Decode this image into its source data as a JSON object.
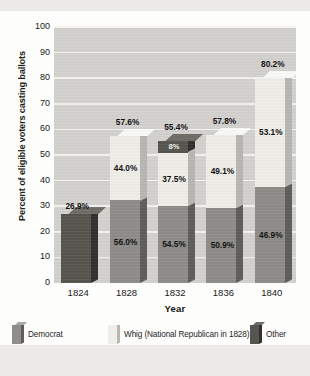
{
  "chart_data": {
    "type": "bar",
    "subtype": "stacked-bar-3d",
    "title": "",
    "xlabel": "Year",
    "ylabel": "Percent of eligible voters casting ballots",
    "categories": [
      "1824",
      "1828",
      "1832",
      "1836",
      "1840"
    ],
    "ylim": [
      0,
      100
    ],
    "yticks": [
      0,
      10,
      20,
      30,
      40,
      50,
      60,
      70,
      80,
      90,
      100
    ],
    "ytick_labels": [
      "0",
      "10",
      "20",
      "30",
      "40",
      "50",
      "60",
      "70",
      "80",
      "90",
      "100"
    ],
    "grid": true,
    "grid_axis": "y",
    "legend_position": "bottom",
    "series": [
      {
        "name": "Democrat",
        "color": "#8e8d89",
        "values": [
          null,
          56.0,
          54.5,
          50.9,
          46.9
        ],
        "value_labels": [
          "",
          "56.0%",
          "54.5%",
          "50.9%",
          "46.9%"
        ]
      },
      {
        "name": "Whig (National Republican in 1828)",
        "color": "#efeee9",
        "values": [
          null,
          44.0,
          37.5,
          49.1,
          53.1
        ],
        "value_labels": [
          "",
          "44.0%",
          "37.5%",
          "49.1%",
          "53.1%"
        ]
      },
      {
        "name": "Other",
        "color": "#56554f",
        "values": [
          26.9,
          null,
          8.0,
          null,
          null
        ],
        "value_labels": [
          "26.9%",
          "",
          "8%",
          "",
          ""
        ]
      }
    ],
    "bar_totals": [
      26.9,
      57.6,
      55.4,
      57.8,
      80.2
    ],
    "bar_total_labels": [
      "26.9%",
      "57.6%",
      "55.4%",
      "57.8%",
      "80.2%"
    ]
  },
  "legend": {
    "items": [
      {
        "label": "Democrat",
        "swatch": "democrat-swatch"
      },
      {
        "label": "Whig (National Republican in 1828)",
        "swatch": "whig-swatch"
      },
      {
        "label": "Other",
        "swatch": "other-swatch"
      }
    ]
  },
  "axes": {
    "y_title": "Percent of eligible voters casting ballots",
    "x_title": "Year"
  }
}
